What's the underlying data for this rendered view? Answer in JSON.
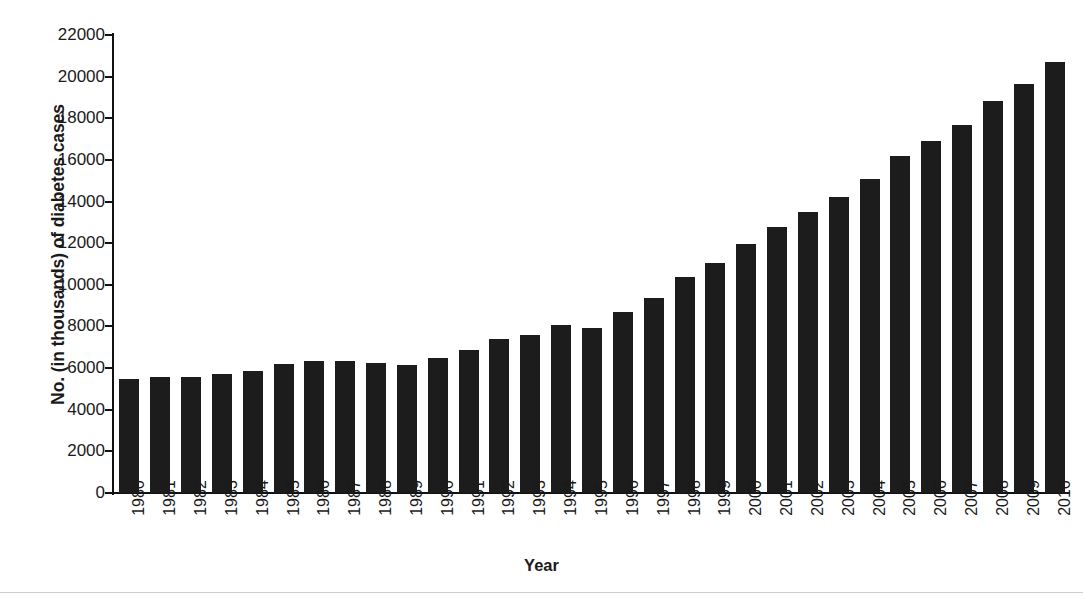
{
  "chart_data": {
    "type": "bar",
    "title": "",
    "xlabel": "Year",
    "ylabel": "No. (in thousands) of diabetes cases",
    "ylim": [
      0,
      22000
    ],
    "yticks": [
      0,
      2000,
      4000,
      6000,
      8000,
      10000,
      12000,
      14000,
      16000,
      18000,
      20000,
      22000
    ],
    "grid": false,
    "legend": null,
    "bar_color": "#1c1c1c",
    "categories": [
      "1980",
      "1981",
      "1982",
      "1983",
      "1984",
      "1985",
      "1986",
      "1987",
      "1988",
      "1989",
      "1990",
      "1991",
      "1992",
      "1993",
      "1994",
      "1995",
      "1996",
      "1997",
      "1998",
      "1999",
      "2000",
      "2001",
      "2002",
      "2003",
      "2004",
      "2005",
      "2006",
      "2007",
      "2008",
      "2009",
      "2010"
    ],
    "values": [
      5500,
      5550,
      5550,
      5700,
      5850,
      6200,
      6350,
      6350,
      6250,
      6150,
      6500,
      6850,
      7400,
      7600,
      8050,
      7950,
      8700,
      9350,
      10400,
      11050,
      11950,
      12800,
      13500,
      14200,
      15100,
      16200,
      16900,
      17700,
      18850,
      19650,
      20700
    ]
  },
  "axes": {
    "y_title": "No. (in thousands) of diabetes cases",
    "x_title": "Year",
    "y_tick_labels": [
      "0",
      "2000",
      "4000",
      "6000",
      "8000",
      "10000",
      "12000",
      "14000",
      "16000",
      "18000",
      "20000",
      "22000"
    ]
  }
}
